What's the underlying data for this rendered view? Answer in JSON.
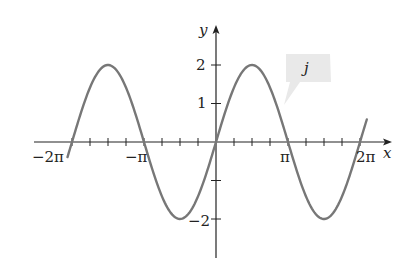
{
  "chart_data": {
    "type": "line",
    "title": "",
    "function": "j(x) = 2 sin(x)",
    "series": [
      {
        "name": "j",
        "amplitude": 2,
        "period": "2π",
        "x": [
          -6.48,
          -6.2832,
          -5.4978,
          -4.7124,
          -3.927,
          -3.1416,
          -2.3562,
          -1.5708,
          -0.7854,
          0,
          0.7854,
          1.5708,
          2.3562,
          3.1416,
          3.927,
          4.7124,
          5.4978,
          6.2832,
          6.58
        ],
        "values": [
          -0.39,
          0,
          1.414,
          2,
          1.414,
          0,
          -1.414,
          -2,
          -1.414,
          0,
          1.414,
          2,
          1.414,
          0,
          -1.414,
          -2,
          -1.414,
          0,
          0.59
        ]
      }
    ],
    "xlabel": "x",
    "ylabel": "y",
    "x_tick_labels": [
      "−2π",
      "−π",
      "π",
      "2π"
    ],
    "x_tick_values": [
      -6.2832,
      -3.1416,
      3.1416,
      6.2832
    ],
    "x_minor_tick_step": "π/4",
    "y_tick_labels": [
      "2",
      "1",
      "−2"
    ],
    "y_tick_values": [
      2,
      1,
      -2,
      -1
    ],
    "xlim": [
      -6.9,
      7.6
    ],
    "ylim": [
      -3.0,
      2.8
    ],
    "grid": false,
    "legend": "none",
    "annotations": [
      {
        "text": "j",
        "type": "callout",
        "points_to": "curve"
      }
    ],
    "line_color": "#777777",
    "axis_color": "#222222"
  },
  "labels": {
    "x_axis": "x",
    "y_axis": "y",
    "x_ticks": [
      "−2π",
      "−π",
      "π",
      "2π"
    ],
    "y_ticks": [
      "2",
      "1",
      "−2"
    ],
    "callout": "j"
  }
}
